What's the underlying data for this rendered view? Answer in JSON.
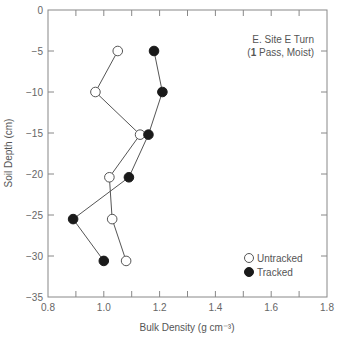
{
  "chart_data": {
    "type": "line",
    "title": "",
    "annotation": [
      "E. Site E Turn",
      "(1 Pass, Moist)"
    ],
    "xlabel": "Bulk Density (g cm⁻³)",
    "ylabel": "Soil Depth (cm)",
    "xlim": [
      0.8,
      1.8
    ],
    "ylim": [
      -35,
      0
    ],
    "x_ticks": [
      "0.8",
      "1.0",
      "1.2",
      "1.4",
      "1.6",
      "1.8"
    ],
    "y_ticks": [
      "0",
      "−5",
      "−10",
      "−15",
      "−20",
      "−25",
      "−30",
      "−35"
    ],
    "grid": false,
    "legend_position": "lower right",
    "series": [
      {
        "name": "Untracked",
        "marker": "open-circle",
        "points": [
          {
            "x": 1.05,
            "y": -5.0
          },
          {
            "x": 0.97,
            "y": -10.0
          },
          {
            "x": 1.13,
            "y": -15.2
          },
          {
            "x": 1.02,
            "y": -20.4
          },
          {
            "x": 1.03,
            "y": -25.5
          },
          {
            "x": 1.08,
            "y": -30.6
          }
        ]
      },
      {
        "name": "Tracked",
        "marker": "filled-circle",
        "points": [
          {
            "x": 1.18,
            "y": -5.0
          },
          {
            "x": 1.21,
            "y": -10.0
          },
          {
            "x": 1.16,
            "y": -15.2
          },
          {
            "x": 1.09,
            "y": -20.4
          },
          {
            "x": 0.89,
            "y": -25.5
          },
          {
            "x": 1.0,
            "y": -30.6
          }
        ]
      }
    ]
  },
  "colors": {
    "axis": "#888888",
    "line": "#555555",
    "marker_fill_tracked": "#1a1a1a",
    "marker_fill_untracked": "#ffffff"
  }
}
